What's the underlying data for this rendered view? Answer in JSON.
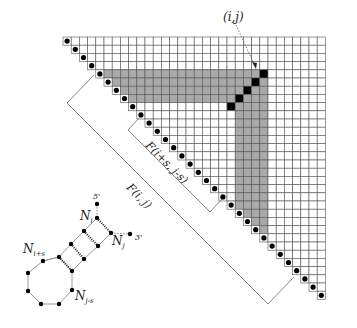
{
  "figure": {
    "grid": {
      "size": 32,
      "origin_x": 63,
      "origin_y": 37,
      "cell": 8.2,
      "gray_top_rows": [
        4,
        7
      ],
      "gray_right_cols": [
        21,
        24
      ],
      "gray_max_col": 24,
      "gray_max_row": 24,
      "black_cells": [
        [
          4,
          24
        ],
        [
          5,
          23
        ],
        [
          6,
          22
        ],
        [
          7,
          21
        ],
        [
          8,
          20
        ]
      ]
    },
    "colors": {
      "gray": "#a9a9a9",
      "black": "#000000",
      "line": "#555555",
      "dot": "#000000"
    },
    "labels": {
      "cell_ij": "(i,j)",
      "bracket_outer": "F(i, j)",
      "bracket_inner": "F(i+s, j-s)"
    },
    "molecule": {
      "n_i": "N",
      "n_i_sub": "i",
      "n_j": "N",
      "n_j_sub": "j",
      "n_is": "N",
      "n_is_sub": "i+s",
      "n_js": "N",
      "n_js_sub": "j-s",
      "five_prime": "5'",
      "three_prime": "3'"
    }
  }
}
